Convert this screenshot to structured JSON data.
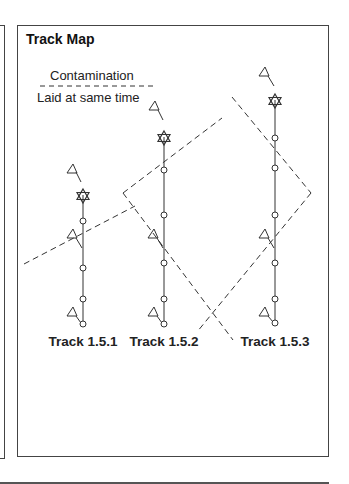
{
  "panel": {
    "title": "Track Map"
  },
  "legend": {
    "line1": "Contamination",
    "line2": "Laid at same time"
  },
  "tracks": [
    {
      "label": "Track 1.5.1",
      "x": 83
    },
    {
      "label": "Track 1.5.2",
      "x": 164
    },
    {
      "label": "Track 1.5.3",
      "x": 275
    }
  ],
  "colors": {
    "line": "#333333",
    "border": "#444444"
  }
}
